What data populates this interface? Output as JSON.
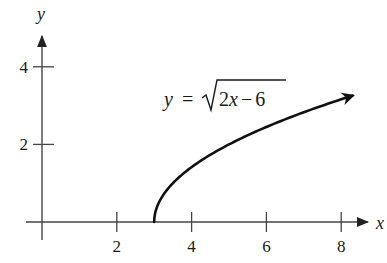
{
  "figure": {
    "clipped_header_visible": true
  },
  "chart_data": {
    "type": "line",
    "title": "",
    "annotation": "y = √(2x − 6)",
    "equation": {
      "lhs": "y",
      "eq": "=",
      "radicand": "2x − 6"
    },
    "xlabel": "x",
    "ylabel": "y",
    "x_ticks": [
      2,
      4,
      6,
      8
    ],
    "x_tick_labels": [
      "2",
      "4",
      "6",
      "8"
    ],
    "y_ticks": [
      2,
      4
    ],
    "y_tick_labels": [
      "2",
      "4"
    ],
    "xlim": [
      -0.1,
      9.0
    ],
    "ylim": [
      -0.6,
      5.0
    ],
    "grid": false,
    "legend": "none",
    "series": [
      {
        "name": "y = sqrt(2x - 6)",
        "domain_start": 3,
        "domain_end": 8.3,
        "arrow_at_end": true,
        "x": [
          3,
          3.05,
          3.2,
          3.5,
          4,
          4.5,
          5,
          5.5,
          6,
          6.5,
          7,
          7.5,
          8,
          8.3
        ],
        "y": [
          0,
          0.32,
          0.63,
          1.0,
          1.41,
          1.73,
          2.0,
          2.24,
          2.45,
          2.65,
          2.83,
          3.0,
          3.16,
          3.26
        ]
      }
    ],
    "colors": {
      "axes": "#444444",
      "curve": "#111111",
      "text": "#1a1a1a"
    }
  }
}
